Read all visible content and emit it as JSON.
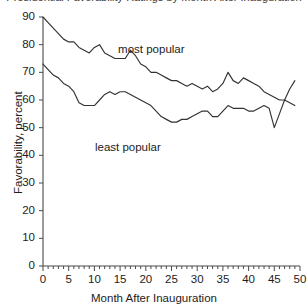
{
  "chart_data": {
    "type": "line",
    "title": "Presidential Favorability Ratings by Month After Inauguration",
    "title_clipped": true,
    "xlabel": "Month After Inauguration",
    "ylabel": "Favorability, percent",
    "xlim": [
      0,
      50
    ],
    "ylim": [
      0,
      90
    ],
    "xticks": [
      0,
      5,
      10,
      15,
      20,
      25,
      30,
      35,
      40,
      45,
      50
    ],
    "yticks": [
      0,
      10,
      20,
      30,
      40,
      50,
      60,
      70,
      80,
      90
    ],
    "x_minor_tick_step": 1,
    "grid": false,
    "legend": "inline-annotations",
    "line_color": "#333333",
    "annotations": [
      {
        "text": "most popular",
        "x": 22.0,
        "y": 78.0
      },
      {
        "text": "least popular",
        "x": 17.5,
        "y": 42.5
      }
    ],
    "x": [
      0,
      1,
      2,
      3,
      4,
      5,
      6,
      7,
      8,
      9,
      10,
      11,
      12,
      13,
      14,
      15,
      16,
      17,
      18,
      19,
      20,
      21,
      22,
      23,
      24,
      25,
      26,
      27,
      28,
      29,
      30,
      31,
      32,
      33,
      34,
      35,
      36,
      37,
      38,
      39,
      40,
      41,
      42,
      43,
      44,
      45,
      46,
      47,
      48,
      49
    ],
    "series": [
      {
        "name": "most popular",
        "values": [
          90,
          88,
          86,
          84,
          82,
          81,
          81,
          79,
          78,
          77,
          79,
          80,
          77,
          76,
          75,
          75,
          75,
          78,
          76,
          73,
          72,
          70,
          70,
          69,
          68,
          67,
          67,
          66,
          65,
          66,
          65,
          64,
          65,
          63,
          64,
          66,
          70,
          67,
          66,
          68,
          67,
          66,
          65,
          63,
          62,
          61,
          60,
          60,
          59,
          58
        ]
      },
      {
        "name": "least popular",
        "values": [
          73,
          71,
          69,
          68,
          66,
          65,
          63,
          59,
          58,
          58,
          58,
          60,
          62,
          63,
          62,
          63,
          63,
          62,
          61,
          60,
          59,
          58,
          56,
          54,
          53,
          52,
          52,
          53,
          53,
          54,
          55,
          56,
          56,
          54,
          54,
          56,
          58,
          57,
          57,
          57,
          56,
          56,
          57,
          58,
          57,
          50,
          55,
          60,
          64,
          67
        ]
      }
    ]
  }
}
